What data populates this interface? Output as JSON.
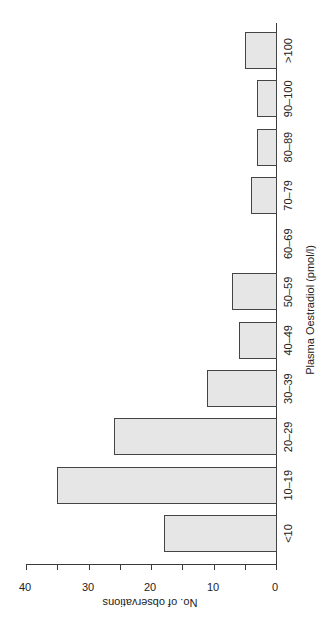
{
  "chart_data": {
    "type": "bar",
    "orientation": "rotated -90deg (categories run bottom-to-top on right axis, bars extend leftward)",
    "title": "",
    "xlabel": "Plasma Oestradiol (pmol/l)",
    "ylabel": "No. of observations",
    "categories": [
      "<10",
      "10–19",
      "20–29",
      "30–39",
      "40–49",
      "50–59",
      "60–69",
      "70–79",
      "80–89",
      "90–100",
      ">100"
    ],
    "values": [
      18,
      35,
      26,
      11,
      6,
      7,
      0,
      4,
      3,
      3,
      5
    ],
    "ylim": [
      0,
      40
    ],
    "yticks": [
      0,
      10,
      20,
      30,
      40
    ],
    "yminor_ticks": [
      5,
      15,
      25,
      35
    ],
    "grid": false,
    "legend": null,
    "bar_fill": "#d8d8d8",
    "bar_edge": "#444444"
  },
  "labels": {
    "xlabel": "Plasma Oestradiol (pmol/l)",
    "ylabel": "No. of observations",
    "categories": [
      "<10",
      "10–19",
      "20–29",
      "30–39",
      "40–49",
      "50–59",
      "60–69",
      "70–79",
      "80–89",
      "90–100",
      ">100"
    ],
    "ticks": [
      "0",
      "10",
      "20",
      "30",
      "40"
    ]
  }
}
